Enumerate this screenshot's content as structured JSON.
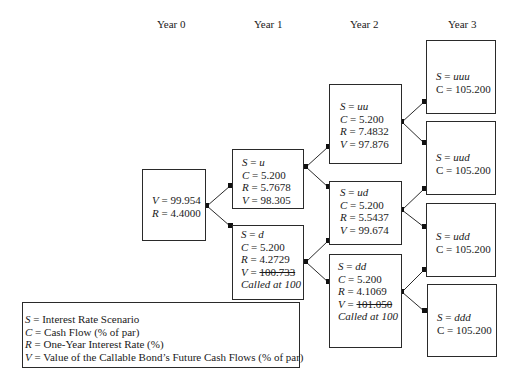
{
  "headers": [
    "Year 0",
    "Year 1",
    "Year 2",
    "Year 3"
  ],
  "nodes": {
    "root": {
      "V_label": "V",
      "V": "99.954",
      "R_label": "R",
      "R": "4.4000"
    },
    "u": {
      "S": "u",
      "C": "5.200",
      "R": "5.7678",
      "V": "98.305"
    },
    "d": {
      "S": "d",
      "C": "5.200",
      "R": "4.2729",
      "V": "100.733",
      "note": "Called at 100"
    },
    "uu": {
      "S": "uu",
      "C": "5.200",
      "R": "7.4832",
      "V": "97.876"
    },
    "ud": {
      "S": "ud",
      "C": "5.200",
      "R": "5.5437",
      "V": "99.674"
    },
    "dd": {
      "S": "dd",
      "C": "5.200",
      "R": "4.1069",
      "V": "101.050",
      "note": "Called at 100"
    },
    "uuu": {
      "S": "uuu",
      "C": "105.200"
    },
    "uud": {
      "S": "uud",
      "C": "105.200"
    },
    "udd": {
      "S": "udd",
      "C": "105.200"
    },
    "ddd": {
      "S": "ddd",
      "C": "105.200"
    }
  },
  "labels": {
    "S": "S = ",
    "C": "C = ",
    "R": "R = ",
    "V": "V = "
  },
  "legend": [
    {
      "sym": "S",
      "text": " = Interest Rate Scenario"
    },
    {
      "sym": "C",
      "text": " = Cash Flow (% of par)"
    },
    {
      "sym": "R",
      "text": " = One-Year Interest Rate (%)"
    },
    {
      "sym": "V",
      "text": " = Value of the Callable Bond’s Future Cash Flows (% of par)"
    }
  ]
}
